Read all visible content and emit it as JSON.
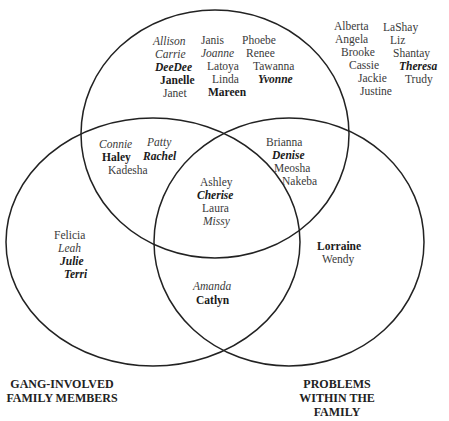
{
  "diagram": {
    "type": "venn",
    "circles": [
      {
        "id": "top",
        "label": ""
      },
      {
        "id": "left",
        "label": "GANG-INVOLVED FAMILY MEMBERS"
      },
      {
        "id": "right",
        "label": "PROBLEMS WITHIN THE FAMILY"
      }
    ],
    "labels": {
      "left_line1": "GANG-INVOLVED",
      "left_line2": "FAMILY MEMBERS",
      "right_line1": "PROBLEMS",
      "right_line2": "WITHIN THE",
      "right_line3": "FAMILY"
    },
    "names": [
      {
        "text": "Allison",
        "style": "italic",
        "region": "top-only"
      },
      {
        "text": "Carrie",
        "style": "italic",
        "region": "top-only"
      },
      {
        "text": "DeeDee",
        "style": "bold-italic",
        "region": "top-only"
      },
      {
        "text": "Janelle",
        "style": "bold",
        "region": "top-only"
      },
      {
        "text": "Janet",
        "style": "regular",
        "region": "top-only"
      },
      {
        "text": "Janis",
        "style": "regular",
        "region": "top-only"
      },
      {
        "text": "Joanne",
        "style": "italic",
        "region": "top-only"
      },
      {
        "text": "Latoya",
        "style": "regular",
        "region": "top-only"
      },
      {
        "text": "Linda",
        "style": "regular",
        "region": "top-only"
      },
      {
        "text": "Mareen",
        "style": "bold",
        "region": "top-only"
      },
      {
        "text": "Phoebe",
        "style": "regular",
        "region": "top-only"
      },
      {
        "text": "Renee",
        "style": "regular",
        "region": "top-only"
      },
      {
        "text": "Tawanna",
        "style": "regular",
        "region": "top-only"
      },
      {
        "text": "Yvonne",
        "style": "bold-italic",
        "region": "top-only"
      },
      {
        "text": "Alberta",
        "style": "regular",
        "region": "outside"
      },
      {
        "text": "Angela",
        "style": "regular",
        "region": "outside"
      },
      {
        "text": "Brooke",
        "style": "regular",
        "region": "outside"
      },
      {
        "text": "Cassie",
        "style": "regular",
        "region": "outside"
      },
      {
        "text": "Jackie",
        "style": "regular",
        "region": "outside"
      },
      {
        "text": "Justine",
        "style": "regular",
        "region": "outside"
      },
      {
        "text": "LaShay",
        "style": "regular",
        "region": "outside"
      },
      {
        "text": "Liz",
        "style": "regular",
        "region": "outside"
      },
      {
        "text": "Shantay",
        "style": "regular",
        "region": "outside"
      },
      {
        "text": "Theresa",
        "style": "bold-italic",
        "region": "outside"
      },
      {
        "text": "Trudy",
        "style": "regular",
        "region": "outside"
      },
      {
        "text": "Connie",
        "style": "italic",
        "region": "top-left"
      },
      {
        "text": "Patty",
        "style": "italic",
        "region": "top-left"
      },
      {
        "text": "Haley",
        "style": "bold",
        "region": "top-left"
      },
      {
        "text": "Rachel",
        "style": "bold-italic",
        "region": "top-left"
      },
      {
        "text": "Kadesha",
        "style": "regular",
        "region": "top-left"
      },
      {
        "text": "Brianna",
        "style": "regular",
        "region": "top-right"
      },
      {
        "text": "Denise",
        "style": "bold-italic",
        "region": "top-right"
      },
      {
        "text": "Meosha",
        "style": "regular",
        "region": "top-right"
      },
      {
        "text": "Nakeba",
        "style": "regular",
        "region": "top-right"
      },
      {
        "text": "Ashley",
        "style": "regular",
        "region": "all-three"
      },
      {
        "text": "Cherise",
        "style": "bold-italic",
        "region": "all-three"
      },
      {
        "text": "Laura",
        "style": "regular",
        "region": "all-three"
      },
      {
        "text": "Missy",
        "style": "italic",
        "region": "all-three"
      },
      {
        "text": "Felicia",
        "style": "regular",
        "region": "left-only"
      },
      {
        "text": "Leah",
        "style": "italic",
        "region": "left-only"
      },
      {
        "text": "Julie",
        "style": "bold-italic",
        "region": "left-only"
      },
      {
        "text": "Terri",
        "style": "bold-italic",
        "region": "left-only"
      },
      {
        "text": "Amanda",
        "style": "italic",
        "region": "left-right"
      },
      {
        "text": "Catlyn",
        "style": "bold",
        "region": "left-right"
      },
      {
        "text": "Lorraine",
        "style": "bold",
        "region": "right-only"
      },
      {
        "text": "Wendy",
        "style": "regular",
        "region": "right-only"
      }
    ]
  }
}
